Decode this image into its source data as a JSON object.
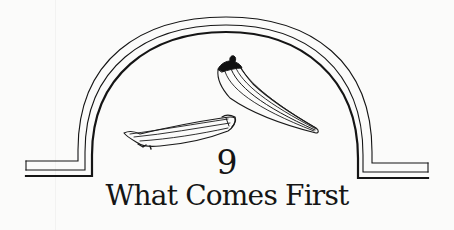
{
  "chapter": {
    "number": "9",
    "title": "What Comes First"
  },
  "illustration": {
    "frame": "arch-frame",
    "subjects": [
      "okra-pod-lying",
      "okra-pod-hanging"
    ]
  },
  "colors": {
    "ink": "#151515",
    "paper": "#fbfbfa"
  }
}
